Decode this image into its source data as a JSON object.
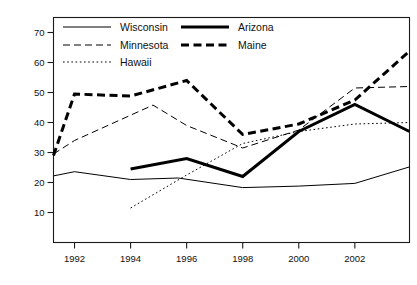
{
  "chart_data": {
    "type": "line",
    "title": "",
    "xlabel": "",
    "ylabel": "",
    "xlim": [
      1991.25,
      2003.95
    ],
    "ylim": [
      0,
      75
    ],
    "grid": false,
    "legend_position": "top-left inside plot",
    "xticks": [
      1992,
      1994,
      1996,
      1998,
      2000,
      2002
    ],
    "xtick_labels": [
      "1992",
      "1994",
      "1996",
      "1998",
      "2000",
      "2002"
    ],
    "yticks": [
      10,
      20,
      30,
      40,
      50,
      60,
      70
    ],
    "ytick_labels": [
      "10",
      "20",
      "30",
      "40",
      "50",
      "60",
      "70"
    ],
    "series": [
      {
        "name": "Wisconsin",
        "style": "thin-solid",
        "x": [
          1991.25,
          1992,
          1994,
          1995.7,
          1998,
          2000,
          2002,
          2003.95
        ],
        "values": [
          22.2,
          23.6,
          21.0,
          21.5,
          18.3,
          18.8,
          19.7,
          25.2
        ]
      },
      {
        "name": "Minnesota",
        "style": "dashed",
        "x": [
          1991.25,
          1992,
          1994.8,
          1996,
          1998,
          2000,
          2002,
          2003.95
        ],
        "values": [
          29.5,
          34.0,
          45.8,
          39.0,
          31.5,
          37.5,
          51.5,
          52.0
        ]
      },
      {
        "name": "Hawaii",
        "style": "dotted",
        "x": [
          1994,
          1996,
          1998,
          2000,
          2002,
          2003.95
        ],
        "values": [
          11.5,
          22.5,
          33.0,
          37.0,
          39.5,
          40.0
        ]
      },
      {
        "name": "Arizona",
        "style": "thick-solid",
        "x": [
          1994,
          1996,
          1998,
          2000,
          2002,
          2003.95
        ],
        "values": [
          24.5,
          28.0,
          22.0,
          37.0,
          46.0,
          37.0
        ]
      },
      {
        "name": "Maine",
        "style": "thick-dashed",
        "x": [
          1991.25,
          1992,
          1994,
          1996,
          1998,
          2000,
          2002,
          2003.95
        ],
        "values": [
          29.0,
          49.5,
          48.8,
          54.0,
          36.0,
          39.5,
          47.5,
          63.8
        ]
      }
    ]
  },
  "legend": {
    "entries": [
      {
        "label": "Wisconsin",
        "style": "thin-solid"
      },
      {
        "label": "Arizona",
        "style": "thick-solid"
      },
      {
        "label": "Minnesota",
        "style": "dashed"
      },
      {
        "label": "Maine",
        "style": "thick-dashed"
      },
      {
        "label": "Hawaii",
        "style": "dotted"
      }
    ]
  },
  "colors": {
    "line": "#000000",
    "frame": "#1a1a1a",
    "background": "#ffffff",
    "text": "#111111"
  }
}
